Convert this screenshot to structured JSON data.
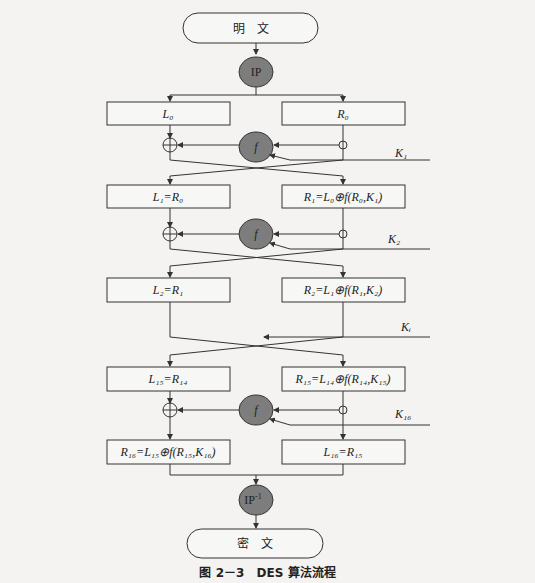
{
  "diagram": {
    "title": "DES 算法流程",
    "start": {
      "label": "明　文"
    },
    "initial_permutation": {
      "label": "IP"
    },
    "rounds": [
      {
        "left": "L₀",
        "right": "R₀",
        "key": "K₁"
      },
      {
        "left": "L₁=R₀",
        "right": "R₁=L₀⊕f(R₀,K₁)",
        "key": "K₂"
      },
      {
        "left": "L₂=R₁",
        "right": "R₂=L₁⊕f(R₁,K₂)",
        "key": "Kᵢ"
      },
      {
        "left": "L₁₅=R₁₄",
        "right": "R₁₅=L₁₄⊕f(R₁₄,K₁₅)",
        "key": "K₁₆"
      },
      {
        "left": "R₁₆=L₁₅⊕f(R₁₅,K₁₆)",
        "right": "L₁₆=R₁₅"
      }
    ],
    "function_label": "f",
    "final_permutation": {
      "label": "IP",
      "superscript": "-1"
    },
    "end": {
      "label": "密　文"
    }
  },
  "caption": {
    "figure_number": "图 2－3",
    "text": "DES 算法流程"
  },
  "colors": {
    "line": "#333333",
    "function_fill": "#7d7d7d",
    "box_fill": "#f7f7f5"
  }
}
